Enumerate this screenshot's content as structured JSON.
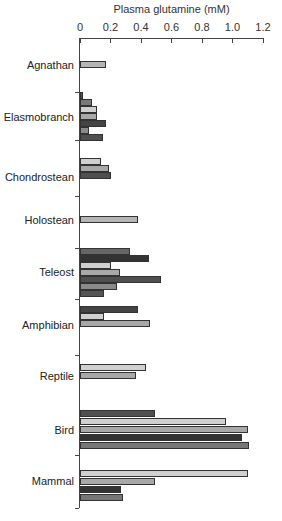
{
  "chart_data": {
    "type": "bar",
    "orientation": "horizontal",
    "title": "",
    "xlabel": "Plasma glutamine (mM)",
    "ylabel": "",
    "xlim": [
      0,
      1.2
    ],
    "xticks": [
      "0",
      "0.2",
      "0.4",
      "0.6",
      "0.8",
      "1.0",
      "1.2"
    ],
    "x_axis_position": "top",
    "grid": false,
    "legend": null,
    "categories": [
      "Agnathan",
      "Elasmobranch",
      "Chondrostean",
      "Holostean",
      "Teleost",
      "Amphibian",
      "Reptile",
      "Bird",
      "Mammal"
    ],
    "groups": [
      {
        "category": "Agnathan",
        "values": [
          0.17
        ]
      },
      {
        "category": "Elasmobranch",
        "values": [
          0.02,
          0.08,
          0.11,
          0.11,
          0.17,
          0.06,
          0.15
        ]
      },
      {
        "category": "Chondrostean",
        "values": [
          0.14,
          0.19,
          0.2
        ]
      },
      {
        "category": "Holostean",
        "values": [
          0.38
        ]
      },
      {
        "category": "Teleost",
        "values": [
          0.33,
          0.45,
          0.2,
          0.26,
          0.53,
          0.24,
          0.16
        ]
      },
      {
        "category": "Amphibian",
        "values": [
          0.38,
          0.16,
          0.46
        ]
      },
      {
        "category": "Reptile",
        "values": [
          0.43,
          0.37
        ]
      },
      {
        "category": "Bird",
        "values": [
          0.49,
          0.96,
          1.1,
          1.06,
          1.11
        ]
      },
      {
        "category": "Mammal",
        "values": [
          1.1,
          0.49,
          0.27,
          0.28
        ]
      }
    ]
  },
  "layout": {
    "x0_px": 80,
    "px_per_unit": 152.5,
    "bar_height": 7,
    "groups": [
      {
        "label_y": 65,
        "bar_tops": [
          61
        ],
        "colors": [
          "#b5b5b5"
        ]
      },
      {
        "label_y": 117,
        "bar_tops": [
          92,
          99,
          106,
          113,
          120,
          127,
          134
        ],
        "colors": [
          "#555555",
          "#7a7a7a",
          "#d0d0d0",
          "#a8a8a8",
          "#444444",
          "#8a8a8a",
          "#4f4f4f"
        ]
      },
      {
        "label_y": 177,
        "bar_tops": [
          158,
          165,
          172
        ],
        "colors": [
          "#d0d0d0",
          "#a8a8a8",
          "#4f4f4f"
        ]
      },
      {
        "label_y": 220,
        "bar_tops": [
          216
        ],
        "colors": [
          "#b5b5b5"
        ]
      },
      {
        "label_y": 272,
        "bar_tops": [
          248,
          255,
          262,
          269,
          276,
          283,
          290
        ],
        "colors": [
          "#666666",
          "#333333",
          "#d0d0d0",
          "#a8a8a8",
          "#4f4f4f",
          "#8a8a8a",
          "#555555"
        ]
      },
      {
        "label_y": 325,
        "bar_tops": [
          306,
          313,
          320
        ],
        "colors": [
          "#444444",
          "#d0d0d0",
          "#a8a8a8"
        ]
      },
      {
        "label_y": 376,
        "bar_tops": [
          364,
          372
        ],
        "colors": [
          "#d0d0d0",
          "#a8a8a8"
        ]
      },
      {
        "label_y": 430,
        "bar_tops": [
          410,
          418,
          426,
          434,
          442
        ],
        "colors": [
          "#4f4f4f",
          "#d0d0d0",
          "#a8a8a8",
          "#333333",
          "#777777"
        ]
      },
      {
        "label_y": 481,
        "bar_tops": [
          470,
          478,
          486,
          494
        ],
        "colors": [
          "#d0d0d0",
          "#a8a8a8",
          "#333333",
          "#777777"
        ]
      }
    ],
    "left_ticks": [
      92,
      140,
      196,
      248,
      299,
      355,
      455,
      508
    ]
  }
}
